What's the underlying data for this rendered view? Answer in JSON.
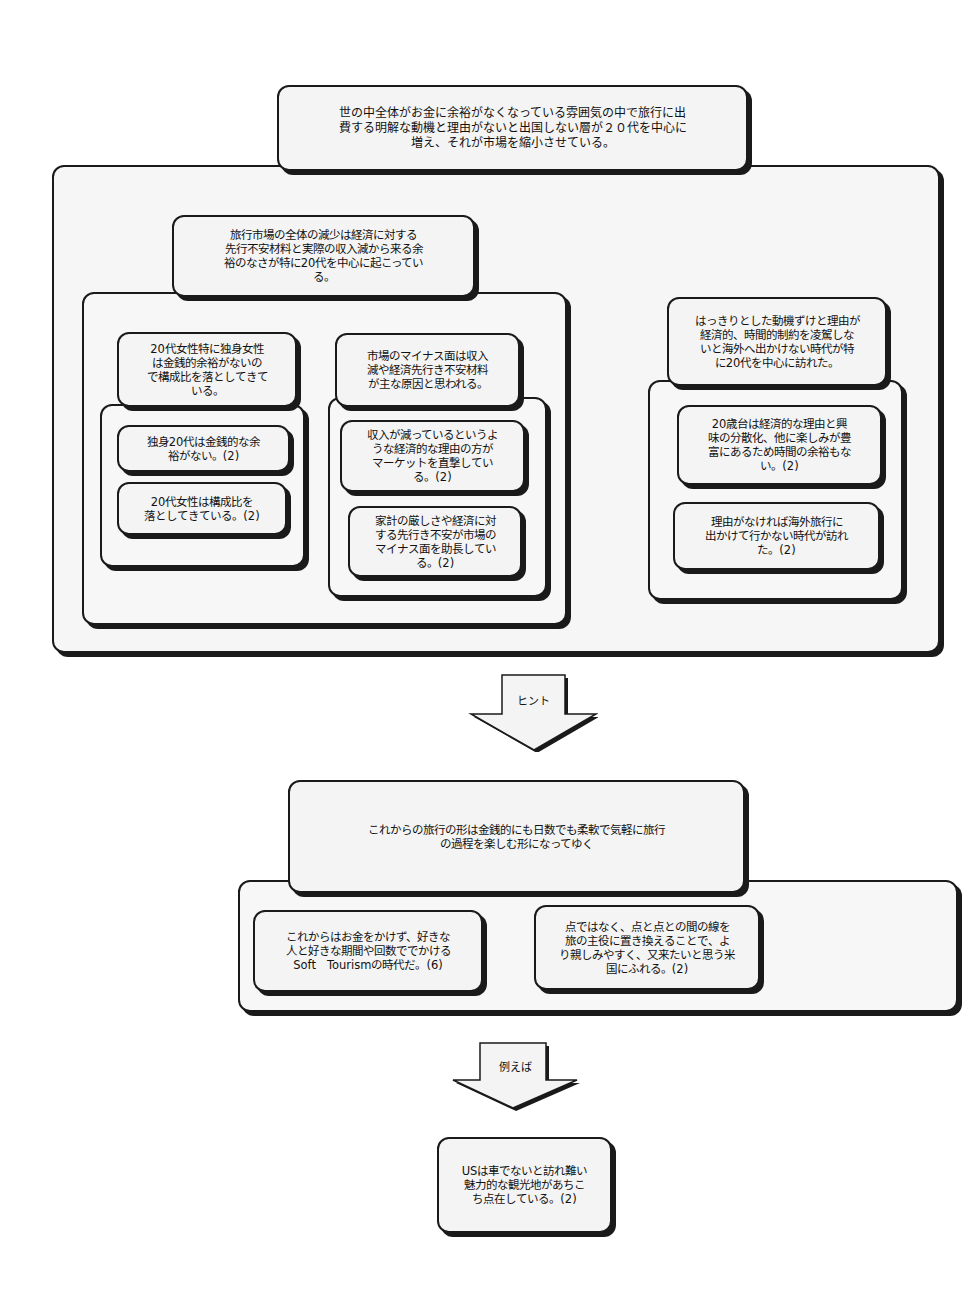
{
  "diagram": {
    "top_conclusion": "世の中全体がお金に余裕がなくなっている雰囲気の中で旅行に出\n費する明解な動機と理由がないと出国しない層が２０代を中心に\n増え、それが市場を縮小させている。",
    "group_a": {
      "title": "旅行市場の全体の減少は経済に対する\n先行不安材料と実際の収入減から来る余\n裕のなさが特に20代を中心に起こってい\nる。",
      "sub_left": {
        "title": "20代女性特に独身女性\nは金銭的余裕がないの\nで構成比を落としてきて\nいる。",
        "items": [
          "独身20代は金銭的な余\n裕がない。(2)",
          "20代女性は構成比を\n落としてきている。(2)"
        ]
      },
      "sub_mid": {
        "title": "市場のマイナス面は収入\n減や経済先行き不安材料\nが主な原因と思われる。",
        "items": [
          "収入が減っているというよ\nうな経済的な理由の方が\nマーケットを直撃してい\nる。(2)",
          "家計の厳しさや経済に対\nする先行き不安が市場の\nマイナス面を助長してい\nる。(2)"
        ]
      }
    },
    "group_b": {
      "title": "はっきりとした動機ずけと理由が\n経済的、時間的制約を凌駕しな\nいと海外へ出かけない時代が特\nに20代を中心に訪れた。",
      "items": [
        "20歳台は経済的な理由と興\n味の分散化、他に楽しみが豊\n富にあるため時間の余裕もな\nい。(2)",
        "理由がなければ海外旅行に\n出かけて行かない時代が訪れ\nた。(2)"
      ]
    },
    "arrow1_label": "ヒント",
    "future": {
      "title": "これからの旅行の形は金銭的にも日数でも柔軟で気軽に旅行\nの過程を楽しむ形になってゆく",
      "items": [
        "これからはお金をかけず、好きな\n人と好きな期間や回数ででかける\nSoft　Tourismの時代だ。(6)",
        "点ではなく、点と点との間の線を\n旅の主役に置き換えることで、よ\nり親しみやすく、又来たいと思う米\n国にふれる。(2)"
      ]
    },
    "arrow2_label": "例えば",
    "example": "USは車でないと訪れ難い\n魅力的な観光地があちこ\nち点在している。(2)"
  },
  "colors": {
    "border": "#1a1a1a",
    "fill": "#f4f4f4",
    "background": "#ffffff"
  }
}
